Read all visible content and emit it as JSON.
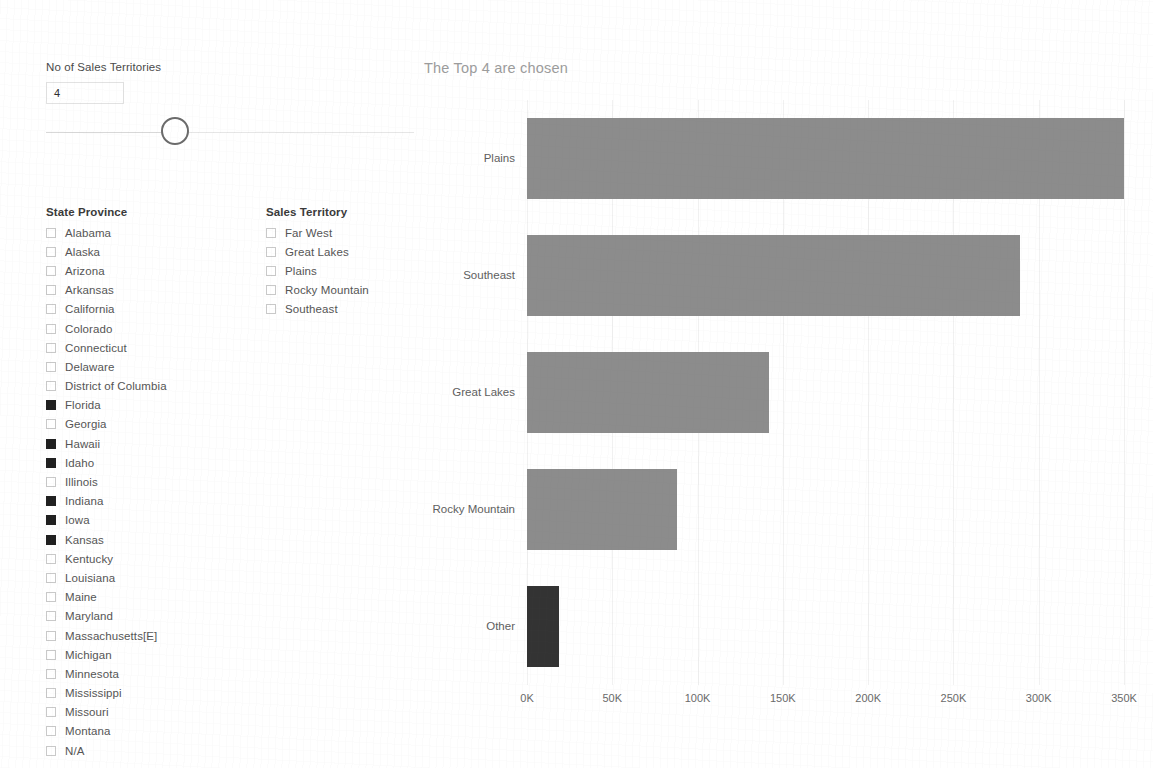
{
  "controls": {
    "slider_label": "No of Sales Territories",
    "value": "4",
    "slider_handle_name": "slider-handle"
  },
  "state_province": {
    "title": "State Province",
    "items": [
      {
        "label": "Alabama",
        "checked": false
      },
      {
        "label": "Alaska",
        "checked": false
      },
      {
        "label": "Arizona",
        "checked": false
      },
      {
        "label": "Arkansas",
        "checked": false
      },
      {
        "label": "California",
        "checked": false
      },
      {
        "label": "Colorado",
        "checked": false
      },
      {
        "label": "Connecticut",
        "checked": false
      },
      {
        "label": "Delaware",
        "checked": false
      },
      {
        "label": "District of Columbia",
        "checked": false
      },
      {
        "label": "Florida",
        "checked": true
      },
      {
        "label": "Georgia",
        "checked": false
      },
      {
        "label": "Hawaii",
        "checked": true
      },
      {
        "label": "Idaho",
        "checked": true
      },
      {
        "label": "Illinois",
        "checked": false
      },
      {
        "label": "Indiana",
        "checked": true
      },
      {
        "label": "Iowa",
        "checked": true
      },
      {
        "label": "Kansas",
        "checked": true
      },
      {
        "label": "Kentucky",
        "checked": false
      },
      {
        "label": "Louisiana",
        "checked": false
      },
      {
        "label": "Maine",
        "checked": false
      },
      {
        "label": "Maryland",
        "checked": false
      },
      {
        "label": "Massachusetts[E]",
        "checked": false
      },
      {
        "label": "Michigan",
        "checked": false
      },
      {
        "label": "Minnesota",
        "checked": false
      },
      {
        "label": "Mississippi",
        "checked": false
      },
      {
        "label": "Missouri",
        "checked": false
      },
      {
        "label": "Montana",
        "checked": false
      },
      {
        "label": "N/A",
        "checked": false
      }
    ]
  },
  "sales_territory": {
    "title": "Sales Territory",
    "items": [
      {
        "label": "Far West",
        "checked": false
      },
      {
        "label": "Great Lakes",
        "checked": false
      },
      {
        "label": "Plains",
        "checked": false
      },
      {
        "label": "Rocky Mountain",
        "checked": false
      },
      {
        "label": "Southeast",
        "checked": false
      }
    ]
  },
  "chart_data": {
    "type": "bar",
    "orientation": "horizontal",
    "title": "The Top 4 are chosen",
    "xlabel": "",
    "ylabel": "",
    "categories": [
      "Plains",
      "Southeast",
      "Great Lakes",
      "Rocky Mountain",
      "Other"
    ],
    "values": [
      350000,
      289000,
      142000,
      88000,
      19000
    ],
    "tick_labels": [
      "0K",
      "50K",
      "100K",
      "150K",
      "200K",
      "250K",
      "300K",
      "350K"
    ],
    "tick_values": [
      0,
      50000,
      100000,
      150000,
      200000,
      250000,
      300000,
      350000
    ],
    "xlim": [
      0,
      350000
    ],
    "grid": true,
    "legend": "none",
    "colors": {
      "bar": "#8c8c8c",
      "other_bar": "#333333",
      "gridline": "#f1f1f1",
      "title": "#9c9c9c"
    },
    "highlight_category": "Other"
  }
}
